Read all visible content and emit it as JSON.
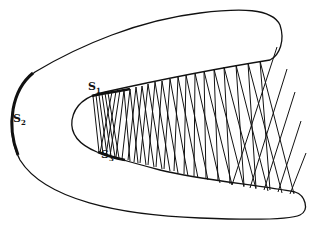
{
  "diagram": {
    "labels": {
      "s1": {
        "main": "S",
        "sub": "1"
      },
      "s2": {
        "main": "S",
        "sub": "2"
      },
      "s3": {
        "main": "S",
        "sub": "3"
      }
    },
    "colors": {
      "stroke": "#111111",
      "background": "#ffffff"
    }
  }
}
